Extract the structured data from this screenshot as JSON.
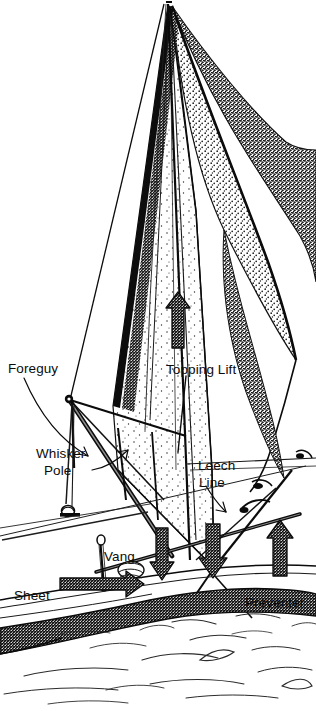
{
  "figure": {
    "style": "pen-and-ink stipple line drawing",
    "background_color": "#ffffff",
    "ink_color": "#0b0b0b",
    "width": 316,
    "height": 711
  },
  "labels": [
    {
      "id": "foreguy",
      "text": "Foreguy",
      "x": 8,
      "y": 361,
      "lines": [
        "Foreguy"
      ]
    },
    {
      "id": "whisker-pole",
      "text": "Whisker Pole",
      "x": 36,
      "y": 446,
      "lines": [
        "Whisker",
        "Pole"
      ]
    },
    {
      "id": "topping-lift",
      "text": "Topping Lift",
      "x": 166,
      "y": 362,
      "lines": [
        "Topping Lift"
      ]
    },
    {
      "id": "leech-line",
      "text": "Leech Line",
      "x": 198,
      "y": 458,
      "lines": [
        "Leech",
        "Line"
      ]
    },
    {
      "id": "vang",
      "text": "Vang",
      "x": 104,
      "y": 549,
      "lines": [
        "Vang"
      ]
    },
    {
      "id": "sheet",
      "text": "Sheet",
      "x": 14,
      "y": 588,
      "lines": [
        "Sheet"
      ]
    },
    {
      "id": "preventer",
      "text": "Preventer",
      "x": 245,
      "y": 595,
      "lines": [
        "Preventer"
      ]
    }
  ],
  "force_arrows": [
    {
      "id": "topping-lift-arrow",
      "label": "Topping Lift",
      "direction": "up",
      "style": "stippled-block"
    },
    {
      "id": "vang-arrow",
      "label": "Vang",
      "direction": "down",
      "style": "stippled-block"
    },
    {
      "id": "leech-line-arrow",
      "label": "Leech Line",
      "direction": "down",
      "style": "stippled-block"
    },
    {
      "id": "sheet-arrow",
      "label": "Sheet",
      "direction": "left",
      "style": "stippled-block"
    },
    {
      "id": "preventer-arrow",
      "label": "Preventer",
      "direction": "up",
      "style": "stippled-block"
    }
  ],
  "leader_arrows": [
    {
      "id": "foreguy-leader",
      "from": "Foreguy",
      "direction": "down-right"
    },
    {
      "id": "whisker-pole-leader",
      "from": "Whisker Pole",
      "direction": "up-right"
    },
    {
      "id": "topping-lift-leader",
      "from": "Topping Lift",
      "direction": "down"
    },
    {
      "id": "leech-line-leader",
      "from": "Leech Line",
      "direction": "down-right"
    }
  ],
  "rig_parts": [
    {
      "id": "mainsail",
      "name": "mainsail",
      "shading": "light-stipple"
    },
    {
      "id": "headsail",
      "name": "headsail-jib",
      "shading": "dense-stipple"
    },
    {
      "id": "mast",
      "name": "mast"
    },
    {
      "id": "boom",
      "name": "boom"
    },
    {
      "id": "whisker-pole-spar",
      "name": "whisker-pole-spar"
    },
    {
      "id": "hull",
      "name": "hull",
      "shading": "dense-stipple"
    },
    {
      "id": "water",
      "name": "water-surface",
      "shading": "wave-lines"
    }
  ]
}
